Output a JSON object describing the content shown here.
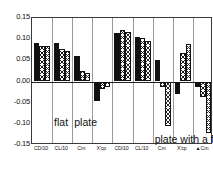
{
  "chart_data": {
    "type": "bar",
    "title": "",
    "xlabel": "",
    "ylabel": "",
    "ylim": [
      -0.15,
      0.15
    ],
    "ytick_labels": [
      "0.15",
      "0.10",
      "0.05",
      "0.00",
      "-0.05",
      "-0.10",
      "-0.15"
    ],
    "ytick_values": [
      0.15,
      0.1,
      0.05,
      0.0,
      -0.05,
      -0.1,
      -0.15
    ],
    "grid": "vertical-group-separators",
    "legend": "none",
    "annotations": [
      {
        "text": "flat",
        "x_group": 1,
        "y": -0.085
      },
      {
        "text": "plate",
        "x_group": 2,
        "y": -0.085
      },
      {
        "text": "plate with a flap",
        "x_group": 6,
        "y": -0.125
      }
    ],
    "annotation_texts": {
      "flat": "flat",
      "plate": "plate",
      "flap": "plate with a flap"
    },
    "categories": [
      "CD/10",
      "CL/10",
      "Cm",
      "X'cp",
      "CD/10",
      "CL/10",
      "Cm",
      "X'cp",
      "▲Cm"
    ],
    "group_labels": [
      {
        "label": "CD/10",
        "condition": "flat plate"
      },
      {
        "label": "CL/10",
        "condition": "flat plate"
      },
      {
        "label": "Cm",
        "condition": "flat plate"
      },
      {
        "label": "X'cp",
        "condition": "flat plate"
      },
      {
        "label": "CD/10",
        "condition": "plate with a flap"
      },
      {
        "label": "CL/10",
        "condition": "plate with a flap"
      },
      {
        "label": "Cm",
        "condition": "plate with a flap"
      },
      {
        "label": "X'cp",
        "condition": "plate with a flap"
      },
      {
        "label": "▲Cm",
        "condition": "plate with a flap"
      }
    ],
    "groups": [
      {
        "name": "flat-plate-CD10",
        "bars": [
          {
            "style": "solid",
            "value": 0.09
          },
          {
            "style": "hatch",
            "value": 0.085
          },
          {
            "style": "hatch2",
            "value": 0.084
          }
        ]
      },
      {
        "name": "flat-plate-CL10",
        "bars": [
          {
            "style": "solid",
            "value": 0.092
          },
          {
            "style": "hatch",
            "value": 0.077
          },
          {
            "style": "hatch2",
            "value": 0.072
          }
        ]
      },
      {
        "name": "flat-plate-Cm",
        "bars": [
          {
            "style": "solid",
            "value": 0.061
          },
          {
            "style": "hatch",
            "value": 0.024
          },
          {
            "style": "hatch2",
            "value": 0.021
          }
        ]
      },
      {
        "name": "flat-plate-Xcp",
        "bars": [
          {
            "style": "solid",
            "value": -0.046
          },
          {
            "style": "hatch",
            "value": -0.018
          },
          {
            "style": "hatch2",
            "value": -0.013
          }
        ]
      },
      {
        "name": "flap-CD10",
        "bars": [
          {
            "style": "solid",
            "value": 0.114
          },
          {
            "style": "hatch",
            "value": 0.122
          },
          {
            "style": "hatch2",
            "value": 0.118
          }
        ]
      },
      {
        "name": "flap-CL10",
        "bars": [
          {
            "style": "solid",
            "value": 0.104
          },
          {
            "style": "hatch",
            "value": 0.103
          },
          {
            "style": "hatch2",
            "value": 0.095
          }
        ]
      },
      {
        "name": "flap-Cm",
        "bars": [
          {
            "style": "solid",
            "value": 0.05
          },
          {
            "style": "hatch",
            "value": -0.012
          },
          {
            "style": "hatch2",
            "value": -0.105
          }
        ]
      },
      {
        "name": "flap-Xcp",
        "bars": [
          {
            "style": "solid",
            "value": -0.03
          },
          {
            "style": "hatch",
            "value": 0.068
          },
          {
            "style": "hatch2",
            "value": 0.089
          }
        ]
      },
      {
        "name": "flap-deltaCm",
        "bars": [
          {
            "style": "solid",
            "value": -0.012
          },
          {
            "style": "hatch",
            "value": -0.036
          },
          {
            "style": "hatch2",
            "value": -0.122
          }
        ]
      }
    ]
  }
}
